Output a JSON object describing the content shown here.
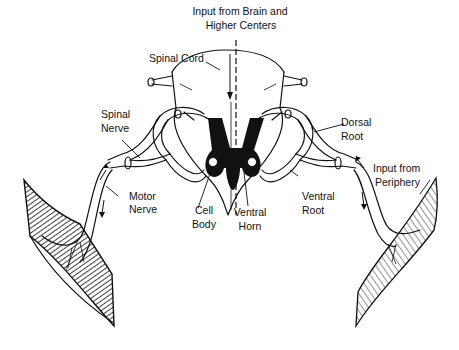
{
  "diagram": {
    "labels": {
      "input_brain_line1": "Input from Brain and",
      "input_brain_line2": "Higher Centers",
      "spinal_cord": "Spinal Cord",
      "spinal_nerve_line1": "Spinal",
      "spinal_nerve_line2": "Nerve",
      "dorsal_root_line1": "Dorsal",
      "dorsal_root_line2": "Root",
      "input_periphery_line1": "Input from",
      "input_periphery_line2": "Periphery",
      "motor_nerve_line1": "Motor",
      "motor_nerve_line2": "Nerve",
      "cell_body_line1": "Cell",
      "cell_body_line2": "Body",
      "ventral_horn_line1": "Ventral",
      "ventral_horn_line2": "Horn",
      "ventral_root_line1": "Ventral",
      "ventral_root_line2": "Root"
    },
    "colors": {
      "ink": "#111111",
      "gray_matter": "#111111",
      "background": "#ffffff"
    }
  }
}
